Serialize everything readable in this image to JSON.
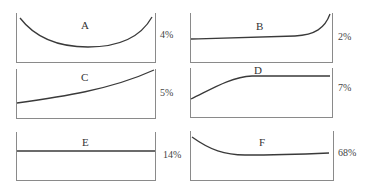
{
  "panels": [
    {
      "id": "A",
      "label": "A",
      "percent": "4%",
      "shape": "u-shaped curve"
    },
    {
      "id": "B",
      "label": "B",
      "percent": "2%",
      "shape": "flat then sharp rise at end"
    },
    {
      "id": "C",
      "label": "C",
      "percent": "5%",
      "shape": "gradual increasing curve"
    },
    {
      "id": "D",
      "label": "D",
      "percent": "7%",
      "shape": "rise then plateau"
    },
    {
      "id": "E",
      "label": "E",
      "percent": "14%",
      "shape": "flat horizontal line"
    },
    {
      "id": "F",
      "label": "F",
      "percent": "68%",
      "shape": "decline then flat"
    }
  ]
}
